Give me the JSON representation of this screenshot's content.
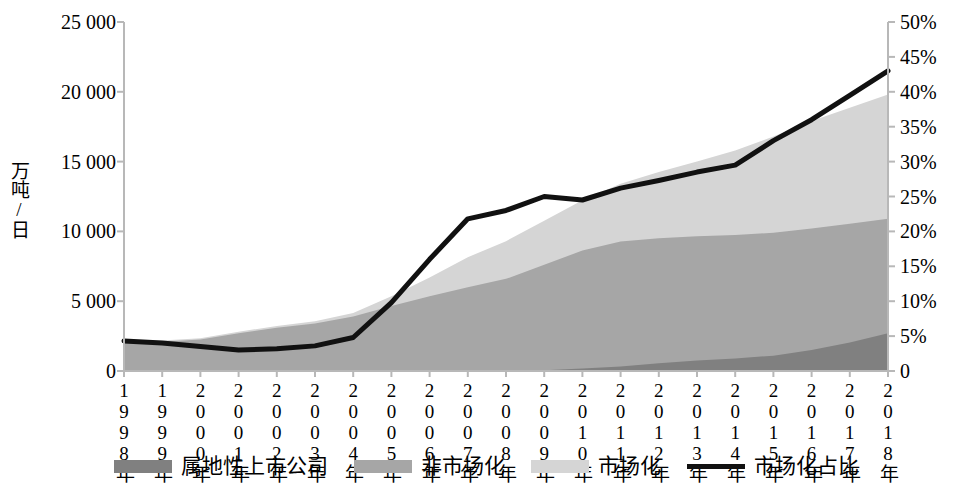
{
  "axes": {
    "y_left_title": "万吨/日",
    "y_left_ticks": [
      "0",
      "5 000",
      "10 000",
      "15 000",
      "20 000",
      "25 000"
    ],
    "y_right_ticks": [
      "0",
      "5%",
      "10%",
      "15%",
      "20%",
      "25%",
      "30%",
      "35%",
      "40%",
      "45%",
      "50%"
    ],
    "x_ticks": [
      "1998年",
      "1999年",
      "2000年",
      "2001年",
      "2002年",
      "2003年",
      "2004年",
      "2005年",
      "2006年",
      "2007年",
      "2008年",
      "2009年",
      "2010年",
      "2011年",
      "2012年",
      "2013年",
      "2014年",
      "2015年",
      "2016年",
      "2017年",
      "2018年"
    ]
  },
  "legend": {
    "items": [
      {
        "label": "属地性上市公司",
        "color": "#808080",
        "kind": "area"
      },
      {
        "label": "非市场化",
        "color": "#a6a6a6",
        "kind": "area"
      },
      {
        "label": "市场化",
        "color": "#d5d5d5",
        "kind": "area"
      },
      {
        "label": "市场化占比",
        "color": "#111111",
        "kind": "line"
      }
    ]
  },
  "colors": {
    "series_local_listed": "#808080",
    "series_non_market": "#a6a6a6",
    "series_market": "#d5d5d5",
    "series_line": "#111111",
    "axis": "#b8b8b8",
    "text": "#000000",
    "background": "#ffffff"
  },
  "chart_data": {
    "type": "area",
    "title": "",
    "xlabel": "",
    "ylabel": "万吨/日",
    "y2label": "",
    "ylim": [
      0,
      25000
    ],
    "y2lim": [
      0,
      0.5
    ],
    "ytick_step": 5000,
    "y2tick_step": 0.05,
    "grid": false,
    "legend_position": "bottom",
    "stacked": true,
    "categories": [
      "1998年",
      "1999年",
      "2000年",
      "2001年",
      "2002年",
      "2003年",
      "2004年",
      "2005年",
      "2006年",
      "2007年",
      "2008年",
      "2009年",
      "2010年",
      "2011年",
      "2012年",
      "2013年",
      "2014年",
      "2015年",
      "2016年",
      "2017年",
      "2018年"
    ],
    "series": [
      {
        "name": "属地性上市公司",
        "axis": "left",
        "unit": "万吨/日",
        "color": "#808080",
        "values": [
          0,
          0,
          0,
          0,
          0,
          0,
          0,
          0,
          0,
          0,
          0,
          60,
          180,
          320,
          560,
          760,
          900,
          1100,
          1500,
          2050,
          2700
        ]
      },
      {
        "name": "非市场化",
        "axis": "left",
        "unit": "万吨/日",
        "color": "#a6a6a6",
        "values": [
          2050,
          2100,
          2250,
          2700,
          3100,
          3400,
          3900,
          4650,
          5350,
          6000,
          6600,
          7550,
          8450,
          8950,
          8950,
          8900,
          8850,
          8800,
          8700,
          8500,
          8200
        ]
      },
      {
        "name": "市场化",
        "axis": "left",
        "unit": "万吨/日",
        "color": "#d5d5d5",
        "values": [
          100,
          80,
          90,
          110,
          130,
          160,
          260,
          700,
          1350,
          2150,
          2700,
          3150,
          3600,
          4150,
          4750,
          5350,
          6050,
          6900,
          7700,
          8300,
          8900
        ]
      },
      {
        "name": "市场化占比",
        "axis": "right",
        "unit": "%",
        "color": "#111111",
        "values": [
          4.3,
          4.0,
          3.5,
          3.0,
          3.2,
          3.6,
          4.8,
          9.8,
          16.0,
          21.8,
          23.0,
          25.0,
          24.5,
          26.2,
          27.3,
          28.5,
          29.5,
          33.0,
          36.0,
          39.5,
          43.0
        ]
      }
    ]
  }
}
